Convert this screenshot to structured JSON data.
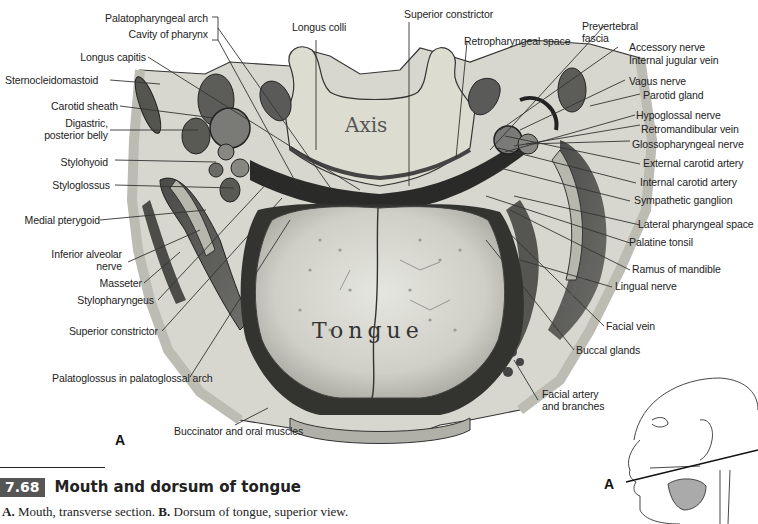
{
  "figure": {
    "number": "7.68",
    "title": "Mouth and dorsum of tongue",
    "caption": {
      "a_letter": "A.",
      "a_text": " Mouth, transverse section. ",
      "b_letter": "B.",
      "b_text": " Dorsum of tongue, superior view."
    },
    "panel_letter": "A",
    "inset_letter": "A",
    "organ_labels": {
      "axis": "Axis",
      "tongue": "Tongue"
    },
    "signature": "E.Blackstock"
  },
  "labels_left": [
    {
      "id": "palatopharyngeal-arch",
      "text": "Palatopharyngeal arch"
    },
    {
      "id": "cavity-of-pharynx",
      "text": "Cavity of pharynx"
    },
    {
      "id": "longus-capitis",
      "text": "Longus capitis"
    },
    {
      "id": "sternocleidomastoid",
      "text": "Sternocleidomastoid"
    },
    {
      "id": "carotid-sheath",
      "text": "Carotid sheath"
    },
    {
      "id": "digastric",
      "text": "Digastric,\nposterior belly"
    },
    {
      "id": "stylohyoid",
      "text": "Stylohyoid"
    },
    {
      "id": "styloglossus",
      "text": "Styloglossus"
    },
    {
      "id": "medial-pterygoid",
      "text": "Medial pterygoid"
    },
    {
      "id": "inferior-alveolar-nerve",
      "text": "Inferior alveolar\nnerve"
    },
    {
      "id": "masseter",
      "text": "Masseter"
    },
    {
      "id": "stylopharyngeus",
      "text": "Stylopharyngeus"
    },
    {
      "id": "superior-constrictor-left",
      "text": "Superior constrictor"
    },
    {
      "id": "palatoglossus",
      "text": "Palatoglossus in palatoglossal arch"
    },
    {
      "id": "buccinator",
      "text": "Buccinator and oral muscles"
    }
  ],
  "labels_top": [
    {
      "id": "longus-colli",
      "text": "Longus colli"
    },
    {
      "id": "superior-constrictor-top",
      "text": "Superior constrictor"
    },
    {
      "id": "retropharyngeal-space",
      "text": "Retropharyngeal space"
    },
    {
      "id": "prevertebral-fascia",
      "text": "Prevertebral\nfascia"
    }
  ],
  "labels_right": [
    {
      "id": "accessory-nerve",
      "text": "Accessory nerve"
    },
    {
      "id": "internal-jugular-vein",
      "text": "Internal jugular vein"
    },
    {
      "id": "vagus-nerve",
      "text": "Vagus nerve"
    },
    {
      "id": "parotid-gland",
      "text": "Parotid gland"
    },
    {
      "id": "hypoglossal-nerve",
      "text": "Hypoglossal nerve"
    },
    {
      "id": "retromandibular-vein",
      "text": "Retromandibular vein"
    },
    {
      "id": "glossopharyngeal-nerve",
      "text": "Glossopharyngeal nerve"
    },
    {
      "id": "external-carotid-artery",
      "text": "External carotid artery"
    },
    {
      "id": "internal-carotid-artery",
      "text": "Internal carotid artery"
    },
    {
      "id": "sympathetic-ganglion",
      "text": "Sympathetic ganglion"
    },
    {
      "id": "lateral-pharyngeal-space",
      "text": "Lateral pharyngeal space"
    },
    {
      "id": "palatine-tonsil",
      "text": "Palatine tonsil"
    },
    {
      "id": "ramus-of-mandible",
      "text": "Ramus of mandible"
    },
    {
      "id": "lingual-nerve",
      "text": "Lingual nerve"
    },
    {
      "id": "facial-vein",
      "text": "Facial vein"
    },
    {
      "id": "buccal-glands",
      "text": "Buccal glands"
    },
    {
      "id": "facial-artery",
      "text": "Facial artery\nand branches"
    }
  ]
}
